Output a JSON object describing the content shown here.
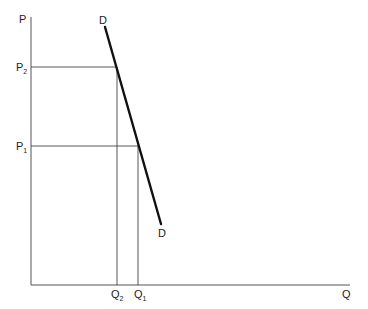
{
  "diagram": {
    "type": "economics-demand-curve",
    "axes": {
      "y_label": "P",
      "x_label": "Q"
    },
    "curve": {
      "name": "D",
      "start_label": "D",
      "end_label": "D",
      "color": "#111111"
    },
    "price_levels": [
      {
        "label": "P",
        "sub": "2"
      },
      {
        "label": "P",
        "sub": "1"
      }
    ],
    "quantity_levels": [
      {
        "label": "Q",
        "sub": "2"
      },
      {
        "label": "Q",
        "sub": "1"
      }
    ],
    "points": [
      {
        "name": "P2-Q2",
        "price": "P2",
        "quantity": "Q2"
      },
      {
        "name": "P1-Q1",
        "price": "P1",
        "quantity": "Q1"
      }
    ]
  }
}
